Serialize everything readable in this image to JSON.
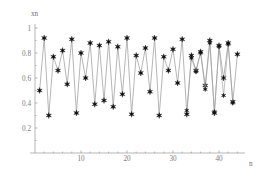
{
  "chart_data": {
    "type": "line",
    "title": "",
    "subtitle": "",
    "xlabel": "n",
    "ylabel": "xn",
    "xlim": [
      0,
      46
    ],
    "ylim": [
      0,
      1.04
    ],
    "grid": false,
    "legend": null,
    "marker": "six-pointed-star",
    "line_color": "#9d9d9d",
    "marker_color": "#111111",
    "axis_color": "#9a9a9a",
    "label_color": "#7b7b7b",
    "xticks": [
      10,
      20,
      30,
      40
    ],
    "xtick_labels": [
      "10",
      "20",
      "30",
      "40"
    ],
    "yticks": [
      0.2,
      0.4,
      0.6,
      0.8,
      1.0
    ],
    "ytick_labels": [
      "0.2",
      "0.4",
      "0.6",
      "0.8",
      "1"
    ],
    "x": [
      1,
      2,
      3,
      4,
      5,
      6,
      7,
      8,
      9,
      10,
      11,
      12,
      13,
      14,
      15,
      16,
      17,
      18,
      19,
      20,
      21,
      22,
      23,
      24,
      25,
      26,
      27,
      28,
      29,
      30,
      31,
      32,
      33,
      34,
      35,
      36,
      37,
      38,
      39,
      40,
      41,
      42,
      43,
      44
    ],
    "values": [
      0.5,
      0.92,
      0.3,
      0.77,
      0.66,
      0.82,
      0.55,
      0.91,
      0.32,
      0.8,
      0.6,
      0.88,
      0.39,
      0.86,
      0.42,
      0.89,
      0.37,
      0.85,
      0.47,
      0.92,
      0.31,
      0.78,
      0.64,
      0.84,
      0.49,
      0.92,
      0.3,
      0.77,
      0.66,
      0.83,
      0.56,
      0.91,
      0.31,
      0.78,
      0.66,
      0.81,
      0.54,
      0.9,
      0.32,
      0.86,
      0.6,
      0.88,
      0.41,
      0.79
    ],
    "series": [
      {
        "name": "xn",
        "values": [
          0.5,
          0.92,
          0.3,
          0.77,
          0.66,
          0.82,
          0.55,
          0.91,
          0.32,
          0.8,
          0.6,
          0.88,
          0.39,
          0.86,
          0.42,
          0.89,
          0.37,
          0.85,
          0.47,
          0.92,
          0.31,
          0.78,
          0.64,
          0.84,
          0.49,
          0.92,
          0.3,
          0.77,
          0.66,
          0.83,
          0.56,
          0.91,
          0.31,
          0.78,
          0.66,
          0.81,
          0.54,
          0.9,
          0.32,
          0.86,
          0.6,
          0.88,
          0.41,
          0.79
        ]
      },
      {
        "name": "xn-secondary",
        "x": [
          33,
          34,
          35,
          36,
          37,
          38,
          39,
          40,
          41,
          42,
          43
        ],
        "values": [
          0.34,
          0.76,
          0.65,
          0.8,
          0.51,
          0.88,
          0.33,
          0.85,
          0.46,
          0.87,
          0.4
        ]
      }
    ]
  },
  "labels": {
    "y_axis_title": "xn",
    "x_axis_title": "n"
  }
}
